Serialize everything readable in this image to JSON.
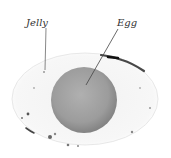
{
  "diagram": {
    "labels": [
      {
        "id": "jelly",
        "text": "Jelly"
      },
      {
        "id": "egg",
        "text": "Egg"
      }
    ],
    "colors": {
      "background": "#ffffff",
      "jelly": "#f4f4f4",
      "egg_center": "#aaaaaa",
      "egg_edge": "#8a8a8a",
      "specks": "#333333",
      "leader_line": "#555555",
      "label_text": "#333333"
    }
  }
}
